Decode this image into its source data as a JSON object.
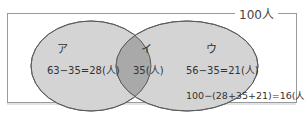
{
  "diagram": {
    "type": "venn",
    "total_label": "100人",
    "sets": [
      {
        "name": "ア",
        "expression": "63−35=28(人)"
      },
      {
        "name": "ウ",
        "expression": "56−35=21(人)"
      }
    ],
    "intersection": {
      "name": "イ",
      "expression": "35(人)"
    },
    "outside": {
      "expression": "100−(28+35+21)=16(人)"
    },
    "colors": {
      "left_fill": "#d2d2d2",
      "right_fill": "#d2d2d2",
      "overlap_fill": "#a8a8a8",
      "stroke": "#555555",
      "frame": "#9a9a9a"
    }
  }
}
